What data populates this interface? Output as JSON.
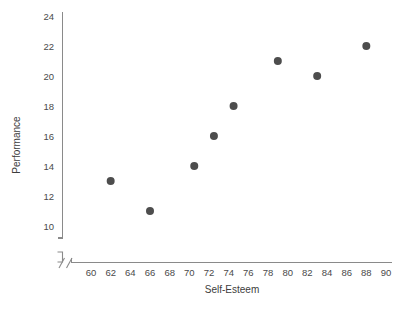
{
  "chart_data": {
    "type": "scatter",
    "title": "",
    "xlabel": "Self-Esteem",
    "ylabel": "Performance",
    "xlim": [
      59,
      91
    ],
    "ylim": [
      9,
      25
    ],
    "grid": false,
    "legend": null,
    "x_ticks": [
      60,
      62,
      64,
      66,
      68,
      70,
      72,
      74,
      76,
      78,
      80,
      82,
      84,
      86,
      88,
      90
    ],
    "y_ticks": [
      10,
      12,
      14,
      16,
      18,
      20,
      22,
      24
    ],
    "axis_break": true,
    "marker": {
      "shape": "circle",
      "color": "#4d4d4d",
      "size": 4
    },
    "points": [
      {
        "x": 62,
        "y": 13
      },
      {
        "x": 66,
        "y": 11
      },
      {
        "x": 70.5,
        "y": 14
      },
      {
        "x": 72.5,
        "y": 16
      },
      {
        "x": 74.5,
        "y": 18
      },
      {
        "x": 79,
        "y": 21
      },
      {
        "x": 83,
        "y": 20
      },
      {
        "x": 88,
        "y": 22
      }
    ]
  },
  "labels": {
    "x_axis_title": "Self-Esteem",
    "y_axis_title": "Performance"
  }
}
